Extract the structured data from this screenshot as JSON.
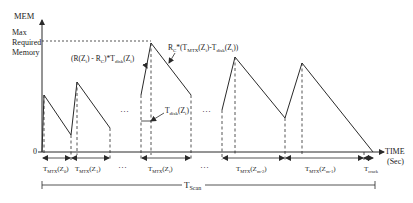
{
  "diagram": {
    "y_axis": {
      "label": "MEM",
      "max_label_lines": [
        "Max",
        "Required",
        "Memory"
      ],
      "origin_label": "0"
    },
    "x_axis": {
      "label": "TIME",
      "unit": "(Sec)"
    },
    "annotations": {
      "rise_formula": "(R(Z",
      "rise_formula_sub_i": "i",
      "rise_formula_mid": ") - R",
      "rise_formula_sub_c": "C",
      "rise_formula_mid2": ")*T",
      "rise_formula_sub_disk": "disk",
      "rise_formula_end": "(Z",
      "rise_formula_sub_end": "i",
      "rise_formula_close": ")",
      "drop_formula_prefix": "R",
      "drop_formula_sub_c": "C",
      "drop_formula_mid": "*(T",
      "drop_formula_sub_mtx": "MTX",
      "drop_formula_mid2": "(Z",
      "drop_formula_sub_i": "i",
      "drop_formula_mid3": ")-T",
      "drop_formula_sub_disk": "disk",
      "drop_formula_mid4": "(Z",
      "drop_formula_sub_i2": "i",
      "drop_formula_close": "))",
      "tdisk_prefix": "T",
      "tdisk_sub": "disk",
      "tdisk_arg": "(Z",
      "tdisk_arg_sub": "i",
      "tdisk_close": ")",
      "ellipsis": "···"
    },
    "intervals": [
      {
        "prefix": "T",
        "sub": "MTX",
        "arg": "(Z",
        "arg_sub": "0",
        "close": ")"
      },
      {
        "prefix": "T",
        "sub": "MTX",
        "arg": "(Z",
        "arg_sub": "1",
        "close": ")"
      },
      {
        "prefix": "T",
        "sub": "MTX",
        "arg": "(Z",
        "arg_sub": "i",
        "close": ")"
      },
      {
        "prefix": "T",
        "sub": "MTX",
        "arg": "(Z",
        "arg_sub": "m-2",
        "close": ")"
      },
      {
        "prefix": "T",
        "sub": "MTX",
        "arg": "(Z",
        "arg_sub": "m-1",
        "close": ")"
      }
    ],
    "tcrack": {
      "prefix": "T",
      "sub": "crack"
    },
    "tscan": {
      "prefix": "T",
      "sub": "Scan"
    },
    "colors": {
      "line": "#2a2a2a",
      "background": "#ffffff"
    }
  }
}
